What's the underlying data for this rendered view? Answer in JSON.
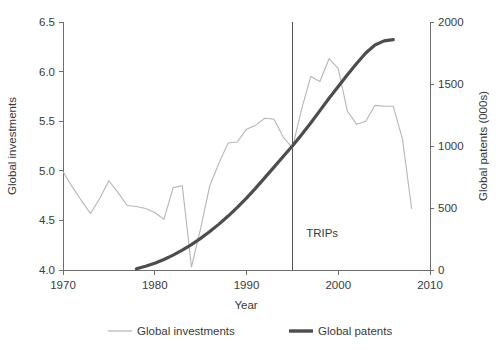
{
  "chart_data": {
    "type": "line",
    "title": "",
    "xlabel": "Year",
    "ylabel_left": "Global investments",
    "ylabel_right": "Global patents (000s)",
    "xlim": [
      1970,
      2010
    ],
    "ylim_left": [
      4.0,
      6.5
    ],
    "ylim_right": [
      0,
      2000
    ],
    "xticks": [
      1970,
      1980,
      1990,
      2000,
      2010
    ],
    "xtick_labels": [
      "1970",
      "1980",
      "1990",
      "2000",
      "2010"
    ],
    "yticks_left": [
      4.0,
      4.5,
      5.0,
      5.5,
      6.0,
      6.5
    ],
    "ytick_labels_left": [
      "4.0",
      "4.5",
      "5.0",
      "5.5",
      "6.0",
      "6.5"
    ],
    "yticks_right": [
      0,
      500,
      1000,
      1500,
      2000
    ],
    "ytick_labels_right": [
      "0",
      "500",
      "1000",
      "1500",
      "2000"
    ],
    "grid": false,
    "legend_position": "bottom",
    "annotations": [
      {
        "text": "TRIPs",
        "x": 1995,
        "label_x": 1996.5,
        "label_y": 4.33,
        "type": "vline"
      }
    ],
    "series": [
      {
        "name": "Global investments",
        "axis": "left",
        "color": "#b5b5b5",
        "width": 1.1,
        "x": [
          1970,
          1971,
          1972,
          1973,
          1974,
          1975,
          1976,
          1977,
          1978,
          1979,
          1980,
          1981,
          1982,
          1983,
          1984,
          1985,
          1986,
          1987,
          1988,
          1989,
          1990,
          1991,
          1992,
          1993,
          1994,
          1995,
          1996,
          1997,
          1998,
          1999,
          2000,
          2001,
          2002,
          2003,
          2004,
          2005,
          2006,
          2007,
          2008
        ],
        "y": [
          4.99,
          4.84,
          4.7,
          4.57,
          4.72,
          4.9,
          4.78,
          4.65,
          4.64,
          4.62,
          4.58,
          4.51,
          4.83,
          4.85,
          4.03,
          4.42,
          4.85,
          5.08,
          5.28,
          5.29,
          5.42,
          5.46,
          5.53,
          5.52,
          5.34,
          5.23,
          5.62,
          5.95,
          5.9,
          6.13,
          6.03,
          5.6,
          5.47,
          5.5,
          5.66,
          5.65,
          5.65,
          5.32,
          4.62
        ]
      },
      {
        "name": "Global patents",
        "axis": "right",
        "color": "#4d4d4d",
        "width": 3.2,
        "x": [
          1978,
          1979,
          1980,
          1981,
          1982,
          1983,
          1984,
          1985,
          1986,
          1987,
          1988,
          1989,
          1990,
          1991,
          1992,
          1993,
          1994,
          1995,
          1996,
          1997,
          1998,
          1999,
          2000,
          2001,
          2002,
          2003,
          2004,
          2005,
          2006
        ],
        "y": [
          10,
          30,
          55,
          85,
          120,
          160,
          205,
          255,
          310,
          370,
          435,
          505,
          580,
          660,
          745,
          830,
          915,
          1000,
          1090,
          1185,
          1285,
          1385,
          1480,
          1575,
          1665,
          1750,
          1815,
          1848,
          1858
        ]
      }
    ]
  },
  "legend": {
    "items": [
      {
        "label": "Global investments",
        "color": "#b5b5b5",
        "width": 1.2
      },
      {
        "label": "Global patents",
        "color": "#4d4d4d",
        "width": 3.4
      }
    ]
  }
}
